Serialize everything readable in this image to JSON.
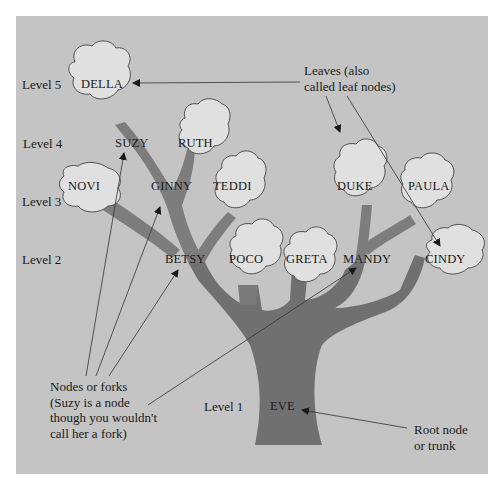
{
  "diagram": {
    "levels": [
      {
        "label": "Level 5"
      },
      {
        "label": "Level 4"
      },
      {
        "label": "Level 3"
      },
      {
        "label": "Level 2"
      },
      {
        "label": "Level 1"
      }
    ],
    "nodes": {
      "della": "DELLA",
      "suzy": "SUZY",
      "ruth": "RUTH",
      "novi": "NOVI",
      "ginny": "GINNY",
      "teddi": "TEDDI",
      "duke": "DUKE",
      "paula": "PAULA",
      "betsy": "BETSY",
      "poco": "POCO",
      "greta": "GRETA",
      "mandy": "MANDY",
      "cindy": "CINDY",
      "eve": "EVE"
    },
    "annotations": {
      "leaves_line1": "Leaves (also",
      "leaves_line2": "called leaf nodes)",
      "forks_line1": "Nodes or forks",
      "forks_line2": "(Suzy is a node",
      "forks_line3": "though you wouldn't",
      "forks_line4": "call her a fork)",
      "root_line1": "Root node",
      "root_line2": "or trunk"
    },
    "colors": {
      "background": "#c4c4c4",
      "branch": "#7a7a7a",
      "trunk": "#6f6f6f",
      "leaf_fill": "#e2e2e2",
      "leaf_stroke": "#555555",
      "arrow": "#2a2a2a"
    }
  }
}
